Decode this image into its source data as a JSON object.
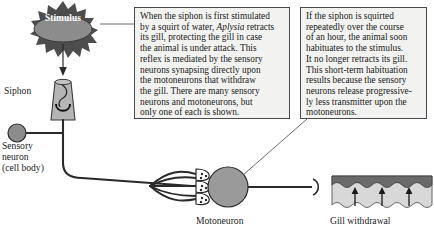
{
  "figure": {
    "colors": {
      "box_fill": "#f2f2f0",
      "box_border": "#4a4a4a",
      "stroke": "#2a2a2a",
      "neuron_gray": "#8c8c8c",
      "starburst_dark": "#4d4d4d",
      "stimulus_oval": "#8c8c8c",
      "gill_dark": "#6a6a6a",
      "gill_light": "#d8d8d8",
      "siphon_fill": "#b5b5b5"
    }
  },
  "stimulus": {
    "label": "Stimulus",
    "icon": "starburst-icon",
    "arrow": "down-arrow-icon"
  },
  "labels": {
    "siphon": "Siphon",
    "sensory_neuron_line1": "Sensory",
    "sensory_neuron_line2": "neuron",
    "sensory_neuron_line3": "(cell body)",
    "motoneuron": "Motoneuron",
    "gill_withdrawal": "Gill withdrawal"
  },
  "callouts": {
    "left": {
      "name": "reflex-description",
      "lines": [
        "When the siphon is first stimulated",
        "by a squirt of water, <i>Aplysia</i> retracts",
        "its gill, protecting the gill in case",
        "the animal is under attack. This",
        "reflex is mediated by the sensory",
        "neurons synapsing directly upon",
        "the motoneurons that withdraw",
        "the gill. There are many sensory",
        "neurons and motoneurons, but",
        "only one of each is shown."
      ]
    },
    "right": {
      "name": "habituation-description",
      "lines": [
        "If the siphon is squirted",
        "repeatedly over the course",
        "of an hour, the animal soon",
        "habituates to the stimulus.",
        "It no longer retracts its gill.",
        "This short-term habituation",
        "results because the sensory",
        "neurons release progressive-",
        "ly less transmitter upon the",
        "motoneurons."
      ]
    }
  }
}
